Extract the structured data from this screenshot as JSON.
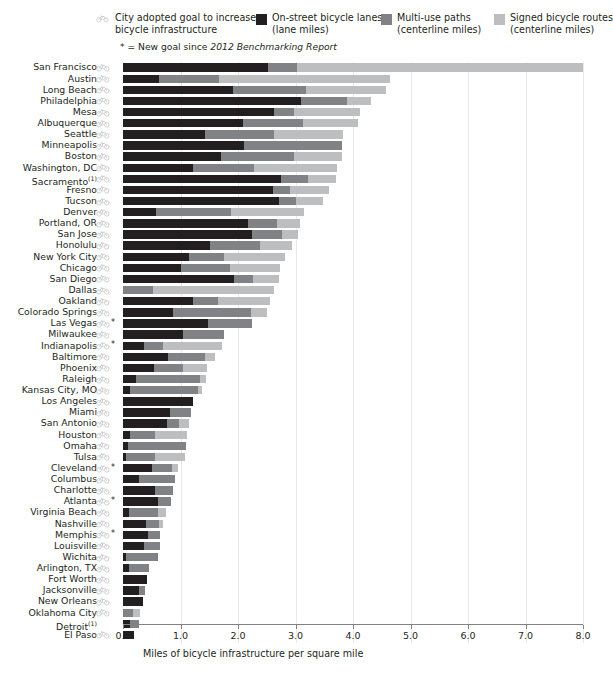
{
  "legend": {
    "goal_icon_name": "bicycle-icon",
    "goal_label_line1": "City adopted goal to increase",
    "goal_label_line2": "bicycle infrastructure",
    "note_asterisk": "*",
    "note_text_pre": " = New goal since ",
    "note_text_italic": "2012 Benchmarking Report",
    "items": [
      {
        "label_line1": "On-street bicycle lanes",
        "label_line2": "(lane miles)",
        "color": "#231f20",
        "swatch_name": "legend-swatch-on-street"
      },
      {
        "label_line1": "Multi-use paths",
        "label_line2": "(centerline miles)",
        "color": "#808285",
        "swatch_name": "legend-swatch-multi-use"
      },
      {
        "label_line1": "Signed bicycle routes",
        "label_line2": "(centerline miles)",
        "color": "#bcbec0",
        "swatch_name": "legend-swatch-signed-routes"
      }
    ]
  },
  "axis": {
    "title": "Miles of bicycle infrastructure per square mile",
    "ticks": [
      "0.0",
      "1.0",
      "2.0",
      "3.0",
      "4.0",
      "5.0",
      "6.0",
      "7.0",
      "8.0"
    ]
  },
  "chart_data": {
    "type": "bar",
    "orientation": "horizontal",
    "stacked": true,
    "title": "",
    "xlabel": "Miles of bicycle infrastructure per square mile",
    "ylabel": "",
    "xlim": [
      0,
      8
    ],
    "xticks": [
      0,
      1,
      2,
      3,
      4,
      5,
      6,
      7,
      8
    ],
    "grid": "vertical-light",
    "legend_position": "top",
    "series": [
      {
        "name": "On-street bicycle lanes (lane miles)",
        "color": "#231f20"
      },
      {
        "name": "Multi-use paths (centerline miles)",
        "color": "#808285"
      },
      {
        "name": "Signed bicycle routes (centerline miles)",
        "color": "#bcbec0"
      }
    ],
    "categories": [
      "San Francisco",
      "Austin",
      "Long Beach",
      "Philadelphia",
      "Mesa",
      "Albuquerque",
      "Seattle",
      "Minneapolis",
      "Boston",
      "Washington, DC",
      "Sacramento",
      "Fresno",
      "Tucson",
      "Denver",
      "Portland, OR",
      "San Jose",
      "Honolulu",
      "New York City",
      "Chicago",
      "San Diego",
      "Dallas",
      "Oakland",
      "Colorado Springs",
      "Las Vegas",
      "Milwaukee",
      "Indianapolis",
      "Baltimore",
      "Phoenix",
      "Raleigh",
      "Kansas City, MO",
      "Los Angeles",
      "Miami",
      "San Antonio",
      "Houston",
      "Omaha",
      "Tulsa",
      "Cleveland",
      "Columbus",
      "Charlotte",
      "Atlanta",
      "Virginia Beach",
      "Nashville",
      "Memphis",
      "Louisville",
      "Wichita",
      "Arlington, TX",
      "Fort Worth",
      "Jacksonville",
      "New Orleans",
      "Oklahoma City",
      "Detroit",
      "El Paso"
    ],
    "rows": [
      {
        "city": "San Francisco",
        "footnote": "",
        "bike_goal": true,
        "new_goal": false,
        "values": [
          2.52,
          0.5,
          4.98
        ],
        "total": 8.0
      },
      {
        "city": "Austin",
        "footnote": "",
        "bike_goal": true,
        "new_goal": false,
        "values": [
          0.62,
          1.05,
          2.97
        ],
        "total": 4.64
      },
      {
        "city": "Long Beach",
        "footnote": "",
        "bike_goal": true,
        "new_goal": false,
        "values": [
          1.91,
          1.28,
          1.38
        ],
        "total": 4.57
      },
      {
        "city": "Philadelphia",
        "footnote": "",
        "bike_goal": true,
        "new_goal": false,
        "values": [
          3.1,
          0.8,
          0.42
        ],
        "total": 4.32
      },
      {
        "city": "Mesa",
        "footnote": "",
        "bike_goal": true,
        "new_goal": false,
        "values": [
          2.63,
          0.35,
          1.15
        ],
        "total": 4.13
      },
      {
        "city": "Albuquerque",
        "footnote": "",
        "bike_goal": true,
        "new_goal": false,
        "values": [
          2.08,
          1.05,
          0.95
        ],
        "total": 4.08
      },
      {
        "city": "Seattle",
        "footnote": "",
        "bike_goal": true,
        "new_goal": false,
        "values": [
          1.43,
          1.2,
          1.2
        ],
        "total": 3.83
      },
      {
        "city": "Minneapolis",
        "footnote": "",
        "bike_goal": true,
        "new_goal": false,
        "values": [
          2.11,
          1.7,
          0.0
        ],
        "total": 3.81
      },
      {
        "city": "Boston",
        "footnote": "",
        "bike_goal": true,
        "new_goal": false,
        "values": [
          1.7,
          1.28,
          0.83
        ],
        "total": 3.81
      },
      {
        "city": "Washington, DC",
        "footnote": "",
        "bike_goal": true,
        "new_goal": false,
        "values": [
          1.22,
          1.05,
          1.45
        ],
        "total": 3.72
      },
      {
        "city": "Sacramento",
        "footnote": "(1)",
        "bike_goal": true,
        "new_goal": false,
        "values": [
          2.74,
          0.48,
          0.48
        ],
        "total": 3.7
      },
      {
        "city": "Fresno",
        "footnote": "",
        "bike_goal": true,
        "new_goal": false,
        "values": [
          2.6,
          0.3,
          0.68
        ],
        "total": 3.58
      },
      {
        "city": "Tucson",
        "footnote": "",
        "bike_goal": true,
        "new_goal": false,
        "values": [
          2.72,
          0.29,
          0.47
        ],
        "total": 3.48
      },
      {
        "city": "Denver",
        "footnote": "",
        "bike_goal": true,
        "new_goal": false,
        "values": [
          0.58,
          1.3,
          1.26
        ],
        "total": 3.14
      },
      {
        "city": "Portland, OR",
        "footnote": "",
        "bike_goal": true,
        "new_goal": false,
        "values": [
          2.17,
          0.5,
          0.4
        ],
        "total": 3.07
      },
      {
        "city": "San Jose",
        "footnote": "",
        "bike_goal": true,
        "new_goal": false,
        "values": [
          2.24,
          0.52,
          0.28
        ],
        "total": 3.04
      },
      {
        "city": "Honolulu",
        "footnote": "",
        "bike_goal": true,
        "new_goal": false,
        "values": [
          1.52,
          0.87,
          0.55
        ],
        "total": 2.94
      },
      {
        "city": "New York City",
        "footnote": "",
        "bike_goal": true,
        "new_goal": false,
        "values": [
          1.15,
          0.6,
          1.07
        ],
        "total": 2.82
      },
      {
        "city": "Chicago",
        "footnote": "",
        "bike_goal": true,
        "new_goal": false,
        "values": [
          1.0,
          0.86,
          0.87
        ],
        "total": 2.73
      },
      {
        "city": "San Diego",
        "footnote": "",
        "bike_goal": true,
        "new_goal": false,
        "values": [
          1.93,
          0.33,
          0.46
        ],
        "total": 2.72
      },
      {
        "city": "Dallas",
        "footnote": "",
        "bike_goal": true,
        "new_goal": false,
        "values": [
          0.0,
          0.53,
          2.1
        ],
        "total": 2.63
      },
      {
        "city": "Oakland",
        "footnote": "",
        "bike_goal": true,
        "new_goal": false,
        "values": [
          1.22,
          0.43,
          0.91
        ],
        "total": 2.56
      },
      {
        "city": "Colorado Springs",
        "footnote": "",
        "bike_goal": true,
        "new_goal": false,
        "values": [
          0.87,
          1.35,
          0.28
        ],
        "total": 2.5
      },
      {
        "city": "Las Vegas",
        "footnote": "",
        "bike_goal": true,
        "new_goal": true,
        "values": [
          1.47,
          0.78,
          0.0
        ],
        "total": 2.25
      },
      {
        "city": "Milwaukee",
        "footnote": "",
        "bike_goal": true,
        "new_goal": false,
        "values": [
          1.04,
          0.72,
          0.0
        ],
        "total": 1.76
      },
      {
        "city": "Indianapolis",
        "footnote": "",
        "bike_goal": true,
        "new_goal": true,
        "values": [
          0.36,
          0.33,
          1.03
        ],
        "total": 1.72
      },
      {
        "city": "Baltimore",
        "footnote": "",
        "bike_goal": true,
        "new_goal": false,
        "values": [
          0.78,
          0.65,
          0.17
        ],
        "total": 1.6
      },
      {
        "city": "Phoenix",
        "footnote": "",
        "bike_goal": true,
        "new_goal": false,
        "values": [
          0.54,
          0.5,
          0.42
        ],
        "total": 1.46
      },
      {
        "city": "Raleigh",
        "footnote": "",
        "bike_goal": true,
        "new_goal": false,
        "values": [
          0.22,
          1.12,
          0.1
        ],
        "total": 1.44
      },
      {
        "city": "Kansas City, MO",
        "footnote": "",
        "bike_goal": true,
        "new_goal": false,
        "values": [
          0.13,
          1.18,
          0.06
        ],
        "total": 1.37
      },
      {
        "city": "Los Angeles",
        "footnote": "",
        "bike_goal": true,
        "new_goal": false,
        "values": [
          1.22,
          0.0,
          0.0
        ],
        "total": 1.22
      },
      {
        "city": "Miami",
        "footnote": "",
        "bike_goal": true,
        "new_goal": false,
        "values": [
          0.82,
          0.37,
          0.0
        ],
        "total": 1.19
      },
      {
        "city": "San Antonio",
        "footnote": "",
        "bike_goal": true,
        "new_goal": false,
        "values": [
          0.76,
          0.21,
          0.17
        ],
        "total": 1.14
      },
      {
        "city": "Houston",
        "footnote": "",
        "bike_goal": true,
        "new_goal": false,
        "values": [
          0.12,
          0.43,
          0.57
        ],
        "total": 1.12
      },
      {
        "city": "Omaha",
        "footnote": "",
        "bike_goal": true,
        "new_goal": false,
        "values": [
          0.08,
          1.01,
          0.0
        ],
        "total": 1.09
      },
      {
        "city": "Tulsa",
        "footnote": "",
        "bike_goal": true,
        "new_goal": false,
        "values": [
          0.05,
          0.5,
          0.52
        ],
        "total": 1.07
      },
      {
        "city": "Cleveland",
        "footnote": "",
        "bike_goal": true,
        "new_goal": true,
        "values": [
          0.5,
          0.35,
          0.1
        ],
        "total": 0.95
      },
      {
        "city": "Columbus",
        "footnote": "",
        "bike_goal": true,
        "new_goal": false,
        "values": [
          0.27,
          0.64,
          0.0
        ],
        "total": 0.91
      },
      {
        "city": "Charlotte",
        "footnote": "",
        "bike_goal": true,
        "new_goal": false,
        "values": [
          0.55,
          0.32,
          0.0
        ],
        "total": 0.87
      },
      {
        "city": "Atlanta",
        "footnote": "",
        "bike_goal": true,
        "new_goal": true,
        "values": [
          0.6,
          0.23,
          0.0
        ],
        "total": 0.83
      },
      {
        "city": "Virginia Beach",
        "footnote": "",
        "bike_goal": true,
        "new_goal": false,
        "values": [
          0.1,
          0.5,
          0.15
        ],
        "total": 0.75
      },
      {
        "city": "Nashville",
        "footnote": "",
        "bike_goal": true,
        "new_goal": false,
        "values": [
          0.4,
          0.22,
          0.08
        ],
        "total": 0.7
      },
      {
        "city": "Memphis",
        "footnote": "",
        "bike_goal": true,
        "new_goal": true,
        "values": [
          0.44,
          0.21,
          0.0
        ],
        "total": 0.65
      },
      {
        "city": "Louisville",
        "footnote": "",
        "bike_goal": true,
        "new_goal": false,
        "values": [
          0.37,
          0.28,
          0.0
        ],
        "total": 0.65
      },
      {
        "city": "Wichita",
        "footnote": "",
        "bike_goal": true,
        "new_goal": false,
        "values": [
          0.05,
          0.55,
          0.0
        ],
        "total": 0.6
      },
      {
        "city": "Arlington, TX",
        "footnote": "",
        "bike_goal": true,
        "new_goal": false,
        "values": [
          0.1,
          0.35,
          0.0
        ],
        "total": 0.45
      },
      {
        "city": "Fort Worth",
        "footnote": "",
        "bike_goal": true,
        "new_goal": false,
        "values": [
          0.42,
          0.0,
          0.0
        ],
        "total": 0.42
      },
      {
        "city": "Jacksonville",
        "footnote": "",
        "bike_goal": true,
        "new_goal": false,
        "values": [
          0.27,
          0.11,
          0.0
        ],
        "total": 0.38
      },
      {
        "city": "New Orleans",
        "footnote": "",
        "bike_goal": true,
        "new_goal": false,
        "values": [
          0.34,
          0.0,
          0.0
        ],
        "total": 0.34
      },
      {
        "city": "Oklahoma City",
        "footnote": "",
        "bike_goal": true,
        "new_goal": false,
        "values": [
          0.0,
          0.17,
          0.12
        ],
        "total": 0.29
      },
      {
        "city": "Detroit",
        "footnote": "(1)",
        "bike_goal": false,
        "new_goal": false,
        "values": [
          0.13,
          0.14,
          0.0
        ],
        "total": 0.27
      },
      {
        "city": "El Paso",
        "footnote": "",
        "bike_goal": true,
        "new_goal": false,
        "values": [
          0.19,
          0.0,
          0.0
        ],
        "total": 0.19
      }
    ]
  }
}
